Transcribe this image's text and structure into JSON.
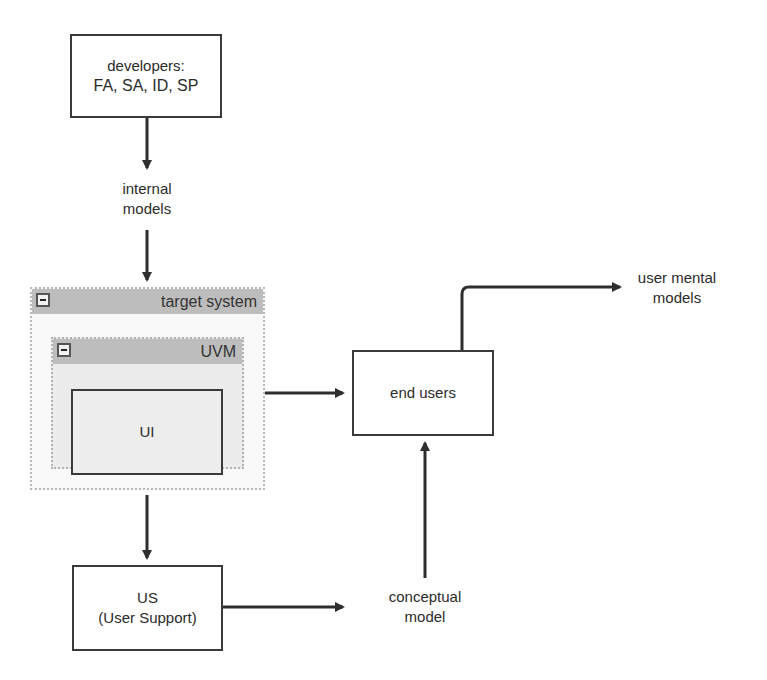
{
  "diagram": {
    "nodes": {
      "developers": {
        "line1": "developers:",
        "line2": "FA, SA, ID, SP"
      },
      "internal_models": {
        "line1": "internal",
        "line2": "models"
      },
      "target_system": {
        "title": "target system"
      },
      "uvm": {
        "title": "UVM"
      },
      "ui": {
        "label": "UI"
      },
      "end_users": {
        "label": "end users"
      },
      "user_mental_models": {
        "line1": "user mental",
        "line2": "models"
      },
      "user_support": {
        "line1": "US",
        "line2": "(User Support)"
      },
      "conceptual_model": {
        "line1": "conceptual",
        "line2": "model"
      }
    },
    "edges": [
      {
        "from": "developers",
        "to": "internal_models"
      },
      {
        "from": "internal_models",
        "to": "target_system"
      },
      {
        "from": "target_system",
        "to": "end_users"
      },
      {
        "from": "end_users",
        "to": "user_mental_models"
      },
      {
        "from": "target_system",
        "to": "user_support"
      },
      {
        "from": "user_support",
        "to": "conceptual_model"
      },
      {
        "from": "conceptual_model",
        "to": "end_users"
      }
    ],
    "colors": {
      "stroke": "#3a3a3a",
      "container_header": "#bdbdbd",
      "inner_fill": "#ececec",
      "outer_fill": "#f9f9f9"
    }
  }
}
